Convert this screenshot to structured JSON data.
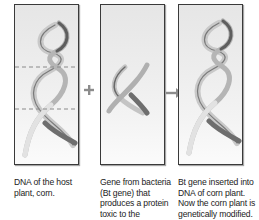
{
  "diagram": {
    "panels": [
      {
        "id": "host-dna",
        "icon": "dna-helix-icon",
        "has_cut_marks": true,
        "caption": "DNA of the host plant, corn."
      },
      {
        "id": "bt-gene",
        "icon": "dna-fragment-icon",
        "has_cut_marks": false,
        "caption": "Gene from bacteria (Bt gene) that produces a protein toxic to the"
      },
      {
        "id": "modified-dna",
        "icon": "dna-helix-icon",
        "has_cut_marks": false,
        "caption": "Bt gene inserted into DNA of corn plant. Now the corn plant is genetically modified."
      }
    ],
    "operators": [
      {
        "symbol": "+",
        "icon": "plus-icon"
      },
      {
        "symbol": "→",
        "icon": "arrow-right-icon"
      }
    ],
    "colors": {
      "ribbon_light": "#d8d8d8",
      "ribbon_dark": "#6e6e6e",
      "cut_line": "#8a8a8a",
      "panel_border": "#3a3a3a",
      "operator": "#8c8c8c"
    }
  }
}
